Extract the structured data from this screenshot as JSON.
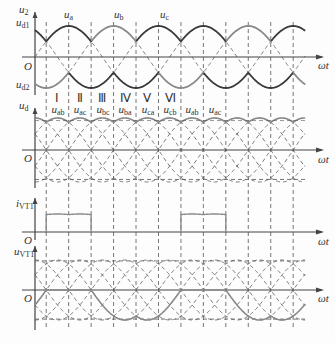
{
  "figure": {
    "type": "three-phase bridge fully-controlled rectifier waveforms (alpha = 0)",
    "colors": {
      "dark_curve": "#3a3a3a",
      "light_curve": "#8a8a8a",
      "dashed": "#555555",
      "axis": "#444444"
    },
    "x_axis_label": "ωt",
    "origin_label": "O"
  },
  "panel_u2": {
    "y_label_main": "u",
    "y_label_main_sub": "2",
    "upper_env_label": "u",
    "upper_env_sub": "d1",
    "lower_env_label": "u",
    "lower_env_sub": "d2",
    "phases": [
      {
        "label": "u",
        "sub": "a"
      },
      {
        "label": "u",
        "sub": "b"
      },
      {
        "label": "u",
        "sub": "c"
      }
    ]
  },
  "intervals": [
    "Ⅰ",
    "Ⅱ",
    "Ⅲ",
    "Ⅳ",
    "Ⅴ",
    "Ⅵ"
  ],
  "panel_ud": {
    "y_label": "u",
    "y_label_sub": "d",
    "segments": [
      {
        "label": "u",
        "sub": "ab"
      },
      {
        "label": "u",
        "sub": "ac"
      },
      {
        "label": "u",
        "sub": "bc"
      },
      {
        "label": "u",
        "sub": "ba"
      },
      {
        "label": "u",
        "sub": "ca"
      },
      {
        "label": "u",
        "sub": "cb"
      },
      {
        "label": "u",
        "sub": "ab"
      },
      {
        "label": "u",
        "sub": "ac"
      }
    ]
  },
  "panel_ivt1": {
    "y_label": "i",
    "y_label_sub": "VT1"
  },
  "panel_uvt1": {
    "y_label": "u",
    "y_label_sub": "VT1"
  }
}
